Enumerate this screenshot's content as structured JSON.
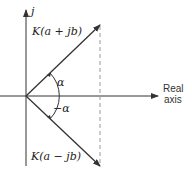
{
  "diagram": {
    "vertical_axis_label": "j",
    "upper_vector_label": "K(a + jb)",
    "lower_vector_label": "K(a − jb)",
    "angle_upper_label": "α",
    "angle_lower_label": "−α",
    "real_axis_label_line1": "Real",
    "real_axis_label_line2": "axis",
    "colors": {
      "stroke": "#333333",
      "dashed": "#999999"
    }
  }
}
